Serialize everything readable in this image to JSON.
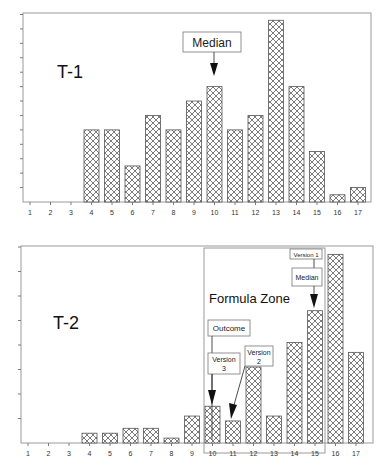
{
  "chart_data": [
    {
      "type": "bar",
      "title": "T-1",
      "panel_label": "T-1",
      "xlabel": "",
      "ylabel": "",
      "categories": [
        "1",
        "2",
        "3",
        "4",
        "5",
        "6",
        "7",
        "8",
        "9",
        "10",
        "11",
        "12",
        "13",
        "14",
        "15",
        "16",
        "17"
      ],
      "values": [
        0,
        0,
        0,
        5,
        5,
        2.5,
        6,
        5,
        7,
        8,
        5,
        6,
        12.6,
        8,
        3.5,
        0.5,
        1
      ],
      "ylim": [
        0,
        13
      ],
      "y_tick_count": 13,
      "y_tick_labels_shown": false,
      "grid": false,
      "pattern": "crosshatch",
      "annotations": [
        {
          "text": "Median",
          "target_category": "10",
          "type": "arrow-callout"
        }
      ]
    },
    {
      "type": "bar",
      "title": "T-2",
      "panel_label": "T-2",
      "xlabel": "",
      "ylabel": "",
      "categories": [
        "1",
        "2",
        "3",
        "4",
        "5",
        "6",
        "7",
        "8",
        "9",
        "10",
        "11",
        "12",
        "13",
        "14",
        "15",
        "16",
        "17"
      ],
      "values": [
        0,
        0,
        0,
        0.4,
        0.4,
        0.6,
        0.6,
        0.2,
        1.1,
        1.5,
        0.9,
        3.1,
        1.1,
        4.1,
        5.4,
        7.7,
        3.7
      ],
      "ylim": [
        0,
        8
      ],
      "y_tick_count": 8,
      "y_tick_labels_shown": false,
      "grid": false,
      "pattern": "crosshatch",
      "region": {
        "label": "Formula Zone",
        "from_category": "10",
        "to_category": "15"
      },
      "annotations": [
        {
          "text": "Outcome",
          "target_category": "10",
          "type": "label"
        },
        {
          "text": "Version 3",
          "target_category": "10",
          "type": "arrow-callout"
        },
        {
          "text": "Version 2",
          "target_category": "11",
          "type": "arrow-callout"
        },
        {
          "text": "Version 1",
          "target_category": "15",
          "type": "label"
        },
        {
          "text": "Median",
          "target_category": "15",
          "type": "arrow-callout"
        }
      ]
    }
  ],
  "labels": {
    "t1": "T-1",
    "t2": "T-2",
    "median_top": "Median",
    "formula_zone": "Formula Zone",
    "outcome": "Outcome",
    "version3_a": "Version",
    "version3_b": "3",
    "version2_a": "Version",
    "version2_b": "2",
    "version1": "Version 1",
    "median_bottom": "Median"
  },
  "x_ticks": [
    "1",
    "2",
    "3",
    "4",
    "5",
    "6",
    "7",
    "8",
    "9",
    "10",
    "11",
    "12",
    "13",
    "14",
    "15",
    "16",
    "17"
  ]
}
